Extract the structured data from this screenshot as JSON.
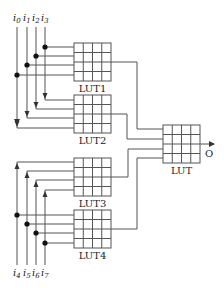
{
  "diagram": {
    "inputs_top": [
      {
        "base": "i",
        "sub": "0"
      },
      {
        "base": "i",
        "sub": "1"
      },
      {
        "base": "i",
        "sub": "2"
      },
      {
        "base": "i",
        "sub": "3"
      }
    ],
    "inputs_bottom": [
      {
        "base": "i",
        "sub": "4"
      },
      {
        "base": "i",
        "sub": "5"
      },
      {
        "base": "i",
        "sub": "6"
      },
      {
        "base": "i",
        "sub": "7"
      }
    ],
    "luts": [
      {
        "name": "LUT1"
      },
      {
        "name": "LUT2"
      },
      {
        "name": "LUT3"
      },
      {
        "name": "LUT4"
      },
      {
        "name": "LUT"
      }
    ],
    "output_label": "O",
    "colors": {
      "line": "#555555",
      "grid": "#555555",
      "text": "#222222"
    }
  }
}
